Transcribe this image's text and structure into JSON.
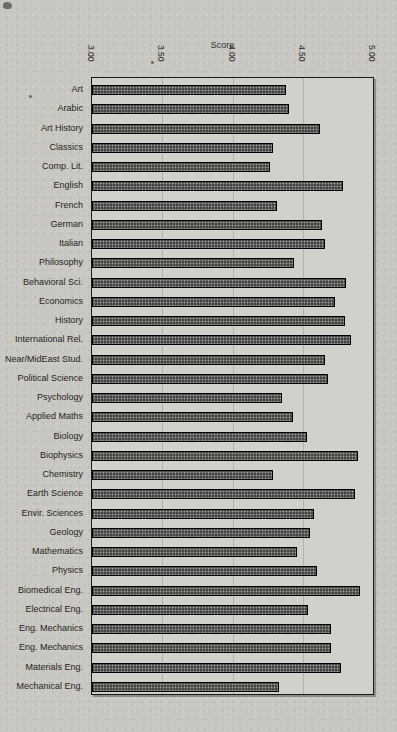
{
  "page": {
    "background_color": "#c8c7c1",
    "plot_background_color": "#d1d0ca",
    "grid_color": "#b4b3ac",
    "text_color": "#222222"
  },
  "chart_data": {
    "type": "bar",
    "orientation": "horizontal",
    "xlabel": "Score",
    "xlim": [
      3.0,
      5.0
    ],
    "xticks": [
      {
        "label": "3.00",
        "value": 3.0
      },
      {
        "label": "3.50",
        "value": 3.5
      },
      {
        "label": "4.00",
        "value": 4.0
      },
      {
        "label": "4.50",
        "value": 4.5
      },
      {
        "label": "5.00",
        "value": 5.0
      }
    ],
    "gridlines": [
      3.5,
      4.0,
      4.5
    ],
    "grid": true,
    "legend": false,
    "categories": [
      "Art",
      "Arabic",
      "Art History",
      "Classics",
      "Comp. Lit.",
      "English",
      "French",
      "German",
      "Italian",
      "Philosophy",
      "Behavioral Sci.",
      "Economics",
      "History",
      "International Rel.",
      "Near/MidEast Stud.",
      "Political Science",
      "Psychology",
      "Applied Maths",
      "Biology",
      "Biophysics",
      "Chemistry",
      "Earth Science",
      "Envir. Sciences",
      "Geology",
      "Mathematics",
      "Physics",
      "Biomedical Eng.",
      "Electrical Eng.",
      "Eng. Mechanics",
      "Eng. Mechanics",
      "Materials Eng.",
      "Mechanical Eng."
    ],
    "values": [
      4.38,
      4.4,
      4.62,
      4.29,
      4.27,
      4.79,
      4.32,
      4.64,
      4.66,
      4.44,
      4.81,
      4.73,
      4.8,
      4.84,
      4.66,
      4.68,
      4.35,
      4.43,
      4.53,
      4.89,
      4.29,
      4.87,
      4.58,
      4.55,
      4.46,
      4.6,
      4.91,
      4.54,
      4.7,
      4.7,
      4.77,
      4.33
    ],
    "bar_colors": {
      "fill": "#474746",
      "dot": "#a2a29c",
      "border": "#000000"
    }
  }
}
